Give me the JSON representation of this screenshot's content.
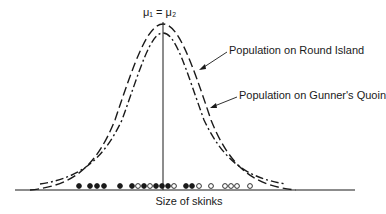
{
  "diagram": {
    "title_mean_label": "μ₁ = μ₂",
    "x_axis_label": "Size of skinks",
    "curves": [
      {
        "name": "Population on Round Island",
        "style": "long-dash",
        "label": "Population on Round Island"
      },
      {
        "name": "Population on Gunner's Quoin",
        "style": "dash-dot",
        "label": "Population on Gunner's Quoin"
      }
    ],
    "samples": {
      "filled_legend": "Round Island sample",
      "open_legend": "Gunner's Quoin sample",
      "points": [
        {
          "x": 79,
          "type": "filled"
        },
        {
          "x": 90,
          "type": "filled"
        },
        {
          "x": 97,
          "type": "filled"
        },
        {
          "x": 104,
          "type": "filled"
        },
        {
          "x": 120,
          "type": "filled"
        },
        {
          "x": 132,
          "type": "filled"
        },
        {
          "x": 138,
          "type": "open"
        },
        {
          "x": 144,
          "type": "filled"
        },
        {
          "x": 150,
          "type": "open"
        },
        {
          "x": 156,
          "type": "filled"
        },
        {
          "x": 162,
          "type": "filled"
        },
        {
          "x": 168,
          "type": "filled"
        },
        {
          "x": 174,
          "type": "open"
        },
        {
          "x": 186,
          "type": "filled"
        },
        {
          "x": 192,
          "type": "filled"
        },
        {
          "x": 199,
          "type": "open"
        },
        {
          "x": 211,
          "type": "open"
        },
        {
          "x": 225,
          "type": "open"
        },
        {
          "x": 231,
          "type": "open"
        },
        {
          "x": 237,
          "type": "open"
        },
        {
          "x": 250,
          "type": "open"
        }
      ]
    },
    "colors": {
      "ink": "#1a1a1a",
      "background": "#ffffff"
    }
  }
}
